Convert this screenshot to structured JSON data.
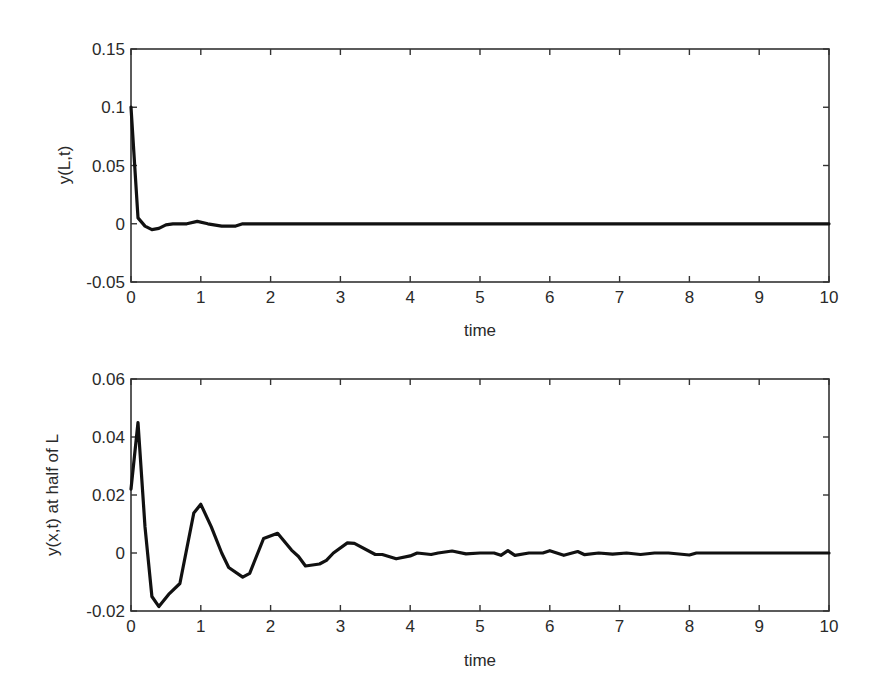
{
  "chart_data": [
    {
      "type": "line",
      "title": "",
      "xlabel": "time",
      "ylabel": "y(L,t)",
      "xlim": [
        0,
        10
      ],
      "ylim": [
        -0.05,
        0.15
      ],
      "xticks": [
        "0",
        "1",
        "2",
        "3",
        "4",
        "5",
        "6",
        "7",
        "8",
        "9",
        "10"
      ],
      "yticks": [
        "-0.05",
        "0",
        "0.05",
        "0.1",
        "0.15"
      ],
      "grid": false,
      "legend": null,
      "series": [
        {
          "name": "y(L,t)",
          "color": "#111111",
          "x": [
            0,
            0.1,
            0.2,
            0.3,
            0.4,
            0.5,
            0.6,
            0.8,
            0.95,
            1.1,
            1.3,
            1.5,
            1.6,
            2.0,
            3.0,
            4.0,
            5.0,
            6.0,
            7.0,
            8.0,
            9.0,
            10.0
          ],
          "values": [
            0.1,
            0.005,
            -0.002,
            -0.005,
            -0.004,
            -0.001,
            0.0,
            0.0,
            0.002,
            0.0,
            -0.002,
            -0.002,
            0.0,
            0.0,
            0.0,
            0.0,
            0.0,
            0.0,
            0.0,
            0.0,
            0.0,
            0.0
          ]
        }
      ]
    },
    {
      "type": "line",
      "title": "",
      "xlabel": "time",
      "ylabel": "y(x,t) at half of L",
      "xlim": [
        0,
        10
      ],
      "ylim": [
        -0.02,
        0.06
      ],
      "xticks": [
        "0",
        "1",
        "2",
        "3",
        "4",
        "5",
        "6",
        "7",
        "8",
        "9",
        "10"
      ],
      "yticks": [
        "-0.02",
        "0",
        "0.02",
        "0.04",
        "0.06"
      ],
      "grid": false,
      "legend": null,
      "series": [
        {
          "name": "y(x,t) at half of L",
          "color": "#111111",
          "x": [
            0,
            0.1,
            0.2,
            0.3,
            0.4,
            0.55,
            0.7,
            0.9,
            1.0,
            1.15,
            1.3,
            1.4,
            1.6,
            1.7,
            1.9,
            2.1,
            2.3,
            2.4,
            2.5,
            2.7,
            2.8,
            2.9,
            3.1,
            3.2,
            3.5,
            3.6,
            3.8,
            4.0,
            4.1,
            4.3,
            4.4,
            4.6,
            4.8,
            5.0,
            5.2,
            5.3,
            5.4,
            5.5,
            5.7,
            5.9,
            6.0,
            6.2,
            6.4,
            6.5,
            6.7,
            6.9,
            7.1,
            7.3,
            7.5,
            7.7,
            8.0,
            8.1,
            8.2,
            9.0,
            10.0
          ],
          "values": [
            0.022,
            0.045,
            0.009,
            -0.015,
            -0.0185,
            -0.014,
            -0.0105,
            0.0138,
            0.0168,
            0.009,
            0.0,
            -0.005,
            -0.0083,
            -0.007,
            0.005,
            0.0068,
            0.001,
            -0.0012,
            -0.0045,
            -0.0038,
            -0.0025,
            0.0,
            0.0035,
            0.0033,
            -0.0005,
            -0.0005,
            -0.002,
            -0.001,
            0.0,
            -0.0005,
            0.0,
            0.0007,
            -0.0003,
            0.0,
            0.0,
            -0.0008,
            0.0008,
            -0.0008,
            0.0,
            0.0,
            0.0008,
            -0.0008,
            0.0005,
            -0.0006,
            0.0,
            -0.0004,
            0.0,
            -0.0005,
            0.0,
            0.0,
            -0.0007,
            0.0,
            0.0,
            0.0,
            0.0
          ]
        }
      ]
    }
  ],
  "plots": [
    {
      "xlabel": "time",
      "ylabel": "y(L,t)",
      "xtick_labels": [
        "0",
        "1",
        "2",
        "3",
        "4",
        "5",
        "6",
        "7",
        "8",
        "9",
        "10"
      ],
      "ytick_labels": [
        "-0.05",
        "0",
        "0.05",
        "0.1",
        "0.15"
      ]
    },
    {
      "xlabel": "time",
      "ylabel": "y(x,t) at half of L",
      "xtick_labels": [
        "0",
        "1",
        "2",
        "3",
        "4",
        "5",
        "6",
        "7",
        "8",
        "9",
        "10"
      ],
      "ytick_labels": [
        "-0.02",
        "0",
        "0.02",
        "0.04",
        "0.06"
      ]
    }
  ]
}
